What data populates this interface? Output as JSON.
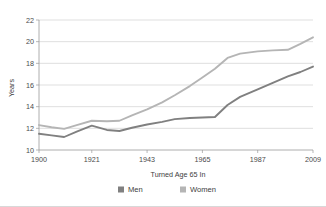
{
  "chart_data": {
    "type": "line",
    "title": "",
    "xlabel": "Turned Age 65 In",
    "ylabel": "Years",
    "xlim": [
      1900,
      2009
    ],
    "ylim": [
      10,
      22
    ],
    "grid": true,
    "legend_position": "bottom",
    "xticks": [
      "1900",
      "1921",
      "1943",
      "1965",
      "1987",
      "2009"
    ],
    "xtick_values": [
      1900,
      1921,
      1943,
      1965,
      1987,
      2009
    ],
    "yticks": [
      "10",
      "12",
      "14",
      "16",
      "18",
      "20",
      "22"
    ],
    "ytick_values": [
      10,
      12,
      14,
      16,
      18,
      20,
      22
    ],
    "x": [
      1900,
      1905,
      1910,
      1915,
      1921,
      1927,
      1932,
      1937,
      1943,
      1949,
      1954,
      1960,
      1965,
      1970,
      1975,
      1980,
      1987,
      1993,
      1999,
      2004,
      2009
    ],
    "series": [
      {
        "name": "Men",
        "color": "#808080",
        "values": [
          11.5,
          11.35,
          11.2,
          11.7,
          12.25,
          11.85,
          11.75,
          12.05,
          12.35,
          12.6,
          12.85,
          12.95,
          13.0,
          13.05,
          14.15,
          14.9,
          15.6,
          16.2,
          16.8,
          17.2,
          17.7
        ]
      },
      {
        "name": "Women",
        "color": "#b5b5b5",
        "values": [
          12.3,
          12.1,
          11.95,
          12.3,
          12.7,
          12.65,
          12.7,
          13.2,
          13.75,
          14.4,
          15.05,
          15.9,
          16.7,
          17.5,
          18.5,
          18.9,
          19.1,
          19.2,
          19.25,
          19.8,
          20.4
        ]
      }
    ]
  },
  "legend": {
    "entries": [
      {
        "label": "Men",
        "color": "#808080"
      },
      {
        "label": "Women",
        "color": "#b5b5b5"
      }
    ]
  },
  "axes": {
    "y_title": "Years",
    "x_title": "Turned Age 65 In"
  }
}
